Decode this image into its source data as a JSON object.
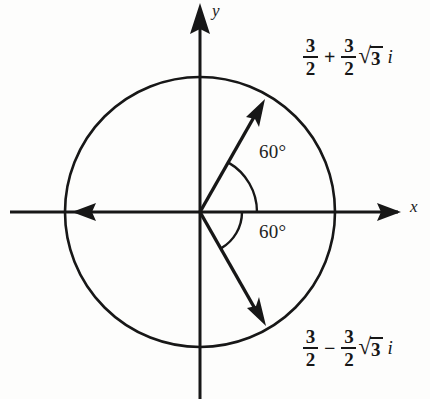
{
  "figure": {
    "background_color": "#fdfdfc",
    "ink_color": "#171717"
  },
  "axes": {
    "x_label": "x",
    "y_label": "y",
    "origin": {
      "x": 200,
      "y": 212
    }
  },
  "circle": {
    "center_x": 200,
    "center_y": 212,
    "radius": 135
  },
  "angles": [
    {
      "name": "upper-angle",
      "text": "60°",
      "value": 60,
      "direction": "counterclockwise-from-positive-x"
    },
    {
      "name": "lower-angle",
      "text": "60°",
      "value": 60,
      "direction": "clockwise-from-positive-x"
    }
  ],
  "vectors": [
    {
      "name": "upper-vector",
      "angle_degrees": 60,
      "tip_x": 263,
      "tip_y": 103,
      "label_ref": "upper"
    },
    {
      "name": "lower-vector",
      "angle_degrees": -60,
      "tip_x": 264,
      "tip_y": 322,
      "label_ref": "lower"
    }
  ],
  "expressions": {
    "upper": {
      "real_num": "3",
      "real_den": "2",
      "operator": "+",
      "coef_num": "3",
      "coef_den": "2",
      "radical_sign": "√",
      "radicand": "3",
      "imaginary_unit": "i",
      "plain": "3/2 + 3/2√3 i"
    },
    "lower": {
      "real_num": "3",
      "real_den": "2",
      "operator": "−",
      "coef_num": "3",
      "coef_den": "2",
      "radical_sign": "√",
      "radicand": "3",
      "imaginary_unit": "i",
      "plain": "3/2 − 3/2√3 i"
    }
  }
}
